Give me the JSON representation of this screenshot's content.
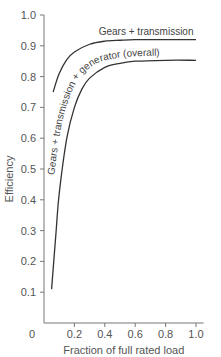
{
  "chart_data": {
    "type": "line",
    "title": "",
    "xlabel": "Fraction of full rated load",
    "ylabel": "Efficiency",
    "xlim": [
      0,
      1.05
    ],
    "ylim": [
      0,
      1.0
    ],
    "grid": false,
    "legend": "inline curve labels",
    "x_ticks": [
      "0",
      "0.2",
      "0.4",
      "0.6",
      "0.8",
      "1.0"
    ],
    "y_ticks": [
      "0.1",
      "0.2",
      "0.3",
      "0.4",
      "0.5",
      "0.6",
      "0.7",
      "0.8",
      "0.9",
      "1.0"
    ],
    "series": [
      {
        "name": "Gears + transmission",
        "x": [
          0.06,
          0.1,
          0.15,
          0.2,
          0.3,
          0.4,
          0.5,
          0.6,
          0.8,
          1.0
        ],
        "y": [
          0.75,
          0.81,
          0.855,
          0.88,
          0.905,
          0.915,
          0.918,
          0.92,
          0.92,
          0.92
        ]
      },
      {
        "name": "Gears + transmission + generator (overall)",
        "x": [
          0.05,
          0.08,
          0.1,
          0.15,
          0.2,
          0.25,
          0.3,
          0.4,
          0.5,
          0.6,
          0.8,
          1.0
        ],
        "y": [
          0.11,
          0.3,
          0.42,
          0.6,
          0.7,
          0.76,
          0.795,
          0.83,
          0.843,
          0.85,
          0.853,
          0.853
        ]
      }
    ]
  }
}
